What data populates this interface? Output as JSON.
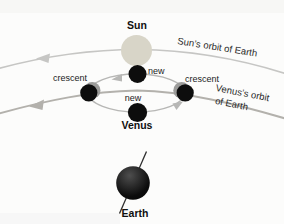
{
  "diagram": {
    "sun": {
      "label": "Sun"
    },
    "suns_orbit": {
      "label": "Sun’s orbit of Earth"
    },
    "epicycle": {
      "new_top": "new",
      "new_bottom": "new",
      "crescent_left": "crescent",
      "crescent_right": "crescent"
    },
    "venus": {
      "label": "Venus"
    },
    "venus_orbit": {
      "line1": "Venus’s orbit",
      "line2": "of Earth"
    },
    "earth": {
      "label": "Earth"
    },
    "colors": {
      "background": "#fcfcfb",
      "sun_fill": "#d8d5c8",
      "sun_orbit_arc": "#c6c6c4",
      "venus_orbit_arc": "#b3b1ac",
      "epicycle_arc": "#b7b7b5",
      "phase_black": "#0d0d0d",
      "crescent_lit": "#9c9c9a",
      "earth_dark": "#050505",
      "earth_highlight": "#4e4e4e",
      "earth_axis": "#2e2e2e",
      "text": "#1b1b1b"
    }
  }
}
